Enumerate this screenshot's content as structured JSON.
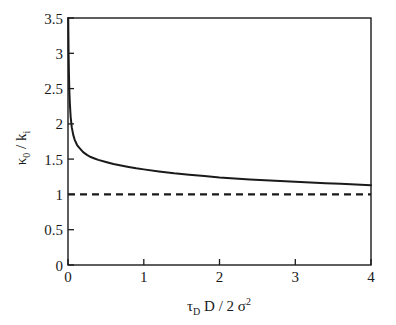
{
  "chart_data": {
    "type": "line",
    "title": "",
    "xlabel": "τ_D D / 2σ²",
    "ylabel": "κ_0 / k_i",
    "xlim": [
      0,
      4
    ],
    "ylim": [
      0,
      3.5
    ],
    "grid": false,
    "legend": "none",
    "xticks": [
      "0",
      "1",
      "2",
      "3",
      "4"
    ],
    "xtick_values": [
      0,
      1,
      2,
      3,
      4
    ],
    "yticks": [
      "0",
      "0.5",
      "1",
      "1.5",
      "2",
      "2.5",
      "3",
      "3.5"
    ],
    "ytick_values": [
      0,
      0.5,
      1,
      1.5,
      2,
      2.5,
      3,
      3.5
    ],
    "series": [
      {
        "name": "kappa0_over_ki",
        "style": "solid",
        "color": "#000000",
        "x": [
          0.003,
          0.005,
          0.008,
          0.012,
          0.018,
          0.025,
          0.035,
          0.05,
          0.07,
          0.09,
          0.12,
          0.15,
          0.2,
          0.25,
          0.3,
          0.35,
          0.4,
          0.5,
          0.6,
          0.7,
          0.8,
          0.9,
          1.0,
          1.2,
          1.4,
          1.6,
          1.8,
          2.0,
          2.2,
          2.4,
          2.6,
          2.8,
          3.0,
          3.2,
          3.4,
          3.6,
          3.8,
          4.0
        ],
        "y": [
          3.5,
          3.3,
          3.0,
          2.72,
          2.46,
          2.28,
          2.1,
          1.95,
          1.84,
          1.77,
          1.7,
          1.66,
          1.6,
          1.56,
          1.53,
          1.51,
          1.49,
          1.46,
          1.43,
          1.41,
          1.39,
          1.37,
          1.355,
          1.325,
          1.3,
          1.28,
          1.26,
          1.24,
          1.225,
          1.212,
          1.2,
          1.19,
          1.18,
          1.17,
          1.16,
          1.15,
          1.14,
          1.13
        ]
      },
      {
        "name": "asymptote",
        "style": "dashed",
        "color": "#000000",
        "x": [
          0,
          4
        ],
        "y": [
          1,
          1
        ]
      }
    ],
    "annotations": []
  },
  "axes": {
    "ylabel_parts": {
      "kappa": "κ",
      "kappa_sub": "0",
      "slash": "/",
      "k": "k",
      "k_sub": "i"
    },
    "xlabel_parts": {
      "tau": "τ",
      "tau_sub": "D",
      "d": "D",
      "slash": "/",
      "two": "2",
      "sigma": "σ",
      "sigma_sup": "2"
    }
  }
}
